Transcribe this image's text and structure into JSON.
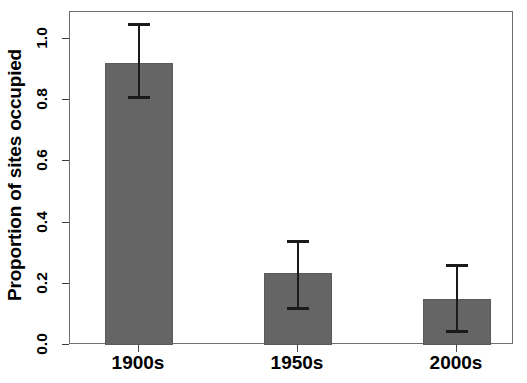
{
  "chart_data": {
    "type": "bar",
    "title": "",
    "xlabel": "",
    "ylabel": "Proportion of sites occupied",
    "categories": [
      "1900s",
      "1950s",
      "2000s"
    ],
    "values": [
      0.92,
      0.235,
      0.15
    ],
    "error_low": [
      0.81,
      0.12,
      0.045
    ],
    "error_high": [
      1.05,
      0.34,
      0.26
    ],
    "ylim": [
      0.0,
      1.08
    ],
    "yticks": [
      0.0,
      0.2,
      0.4,
      0.6,
      0.8,
      1.0
    ],
    "ytick_labels": [
      "0.0",
      "0.2",
      "0.4",
      "0.6",
      "0.8",
      "1.0"
    ],
    "grid": false,
    "legend": "none",
    "bar_color": "#656565",
    "bar_border_color": "#5a5a5a",
    "errorbar_color": "#1a1a1a",
    "frame_color": "#6e6e6e",
    "background": "#ffffff"
  },
  "caption": {
    "text": ""
  }
}
